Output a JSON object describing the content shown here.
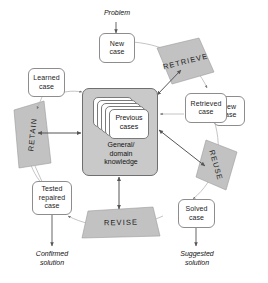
{
  "diagram": {
    "colors": {
      "banner_fill": "#c2c2c2",
      "banner_stroke": "#9a9a9a",
      "knowledge_fill": "#c9c9c9",
      "knowledge_stroke": "#6f6f6f",
      "box_fill": "#ffffff",
      "box_stroke": "#8d8d8d",
      "arrow": "#555555",
      "cycle_arc": "#b5b5b5",
      "text": "#111111"
    },
    "free_labels": {
      "problem": "Problem",
      "confirmed_solution_line1": "Confirmed",
      "confirmed_solution_line2": "solution",
      "suggested_solution_line1": "Suggested",
      "suggested_solution_line2": "solution"
    },
    "case_boxes": {
      "new_case_line1": "New",
      "new_case_line2": "case",
      "learned_case_line1": "Learned",
      "learned_case_line2": "case",
      "tested_repaired_case_line1": "Tested",
      "tested_repaired_case_line2": "repaired",
      "tested_repaired_case_line3": "case",
      "retrieved_case_line1": "Retrieved",
      "retrieved_case_line2": "case",
      "retrieved_new_case_line1": "New",
      "retrieved_new_case_line2": "case",
      "solved_case_line1": "Solved",
      "solved_case_line2": "case"
    },
    "knowledge": {
      "previous_cases_line1": "Previous",
      "previous_cases_line2": "cases",
      "general_line1": "General/",
      "general_line2": "domain",
      "general_line3": "knowledge"
    },
    "process_banners": {
      "retrieve": "RETRIEVE",
      "reuse": "REUSE",
      "revise": "REVISE",
      "retain": "RETAIN"
    }
  }
}
